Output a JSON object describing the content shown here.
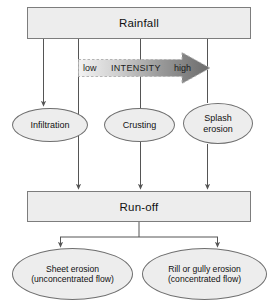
{
  "diagram": {
    "background_color": "#ffffff",
    "node_fill_color": "#ededed",
    "node_border_color": "#7d7d7d",
    "edge_color": "#555555",
    "boxes": [
      {
        "id": "rainfall",
        "label": "Rainfall"
      },
      {
        "id": "runoff",
        "label": "Run-off"
      }
    ],
    "ellipses": [
      {
        "id": "infiltration",
        "line1": "Infiltration",
        "line2": ""
      },
      {
        "id": "crusting",
        "line1": "Crusting",
        "line2": ""
      },
      {
        "id": "splash",
        "line1": "Splash",
        "line2": "erosion"
      },
      {
        "id": "sheet",
        "line1": "Sheet erosion",
        "line2": "(unconcentrated flow)"
      },
      {
        "id": "rill",
        "line1": "Rill or gully erosion",
        "line2": "(concentrated flow)"
      }
    ],
    "intensity_arrow": {
      "low_label": "low",
      "axis_label": "INTENSITY",
      "high_label": "high",
      "gradient_start_color": "#f1f1f1",
      "gradient_end_color": "#6e6e6e",
      "direction": "left-to-right increasing"
    }
  }
}
